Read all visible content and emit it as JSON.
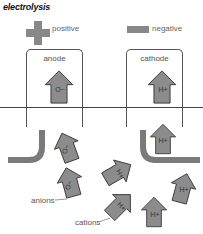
{
  "title": "electrolysis",
  "legend": {
    "positive": {
      "label": "positive",
      "symbol": "plus-icon"
    },
    "negative": {
      "label": "negative",
      "symbol": "minus-icon"
    }
  },
  "electrodes": {
    "anode": {
      "label": "anode"
    },
    "cathode": {
      "label": "cathode"
    }
  },
  "labels": {
    "anions": "anions",
    "cations": "cations"
  },
  "ions": {
    "anion": "O−",
    "cation": "H+"
  },
  "colors": {
    "arrow_fill": "#8c8c8c",
    "arrow_stroke": "#333333",
    "electrode": "#7a7a7a",
    "line": "#444444"
  }
}
